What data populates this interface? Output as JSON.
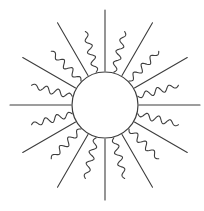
{
  "figure": {
    "name": "sun-line-drawing",
    "canvas": {
      "width": 204,
      "height": 211
    },
    "background_color": "#ffffff",
    "stroke_color": "#3d3d3d",
    "stroke_width": 1.1
  },
  "chart_data": {
    "type": "scatter",
    "xlabel": "",
    "ylabel": "",
    "center": {
      "x": 105,
      "y": 105
    },
    "core_radius": 33,
    "ray_count": 24,
    "ray_angle_step_degrees": 15,
    "ray_start_radius": 34,
    "straight_ray_outer_radius": 95,
    "wavy_ray_outer_radius": 76,
    "wave_amplitude": 3.4,
    "wave_cycles": 3.5,
    "rays": [
      {
        "index": 0,
        "angle": 0,
        "type": "straight"
      },
      {
        "index": 1,
        "angle": 15,
        "type": "wavy"
      },
      {
        "index": 2,
        "angle": 30,
        "type": "straight"
      },
      {
        "index": 3,
        "angle": 45,
        "type": "wavy"
      },
      {
        "index": 4,
        "angle": 60,
        "type": "straight"
      },
      {
        "index": 5,
        "angle": 75,
        "type": "wavy"
      },
      {
        "index": 6,
        "angle": 90,
        "type": "straight"
      },
      {
        "index": 7,
        "angle": 105,
        "type": "wavy"
      },
      {
        "index": 8,
        "angle": 120,
        "type": "straight"
      },
      {
        "index": 9,
        "angle": 135,
        "type": "wavy"
      },
      {
        "index": 10,
        "angle": 150,
        "type": "straight"
      },
      {
        "index": 11,
        "angle": 165,
        "type": "wavy"
      },
      {
        "index": 12,
        "angle": 180,
        "type": "straight"
      },
      {
        "index": 13,
        "angle": 195,
        "type": "wavy"
      },
      {
        "index": 14,
        "angle": 210,
        "type": "straight"
      },
      {
        "index": 15,
        "angle": 225,
        "type": "wavy"
      },
      {
        "index": 16,
        "angle": 240,
        "type": "straight"
      },
      {
        "index": 17,
        "angle": 255,
        "type": "wavy"
      },
      {
        "index": 18,
        "angle": 270,
        "type": "straight"
      },
      {
        "index": 19,
        "angle": 285,
        "type": "wavy"
      },
      {
        "index": 20,
        "angle": 300,
        "type": "straight"
      },
      {
        "index": 21,
        "angle": 315,
        "type": "wavy"
      },
      {
        "index": 22,
        "angle": 330,
        "type": "straight"
      },
      {
        "index": 23,
        "angle": 345,
        "type": "wavy"
      }
    ]
  }
}
